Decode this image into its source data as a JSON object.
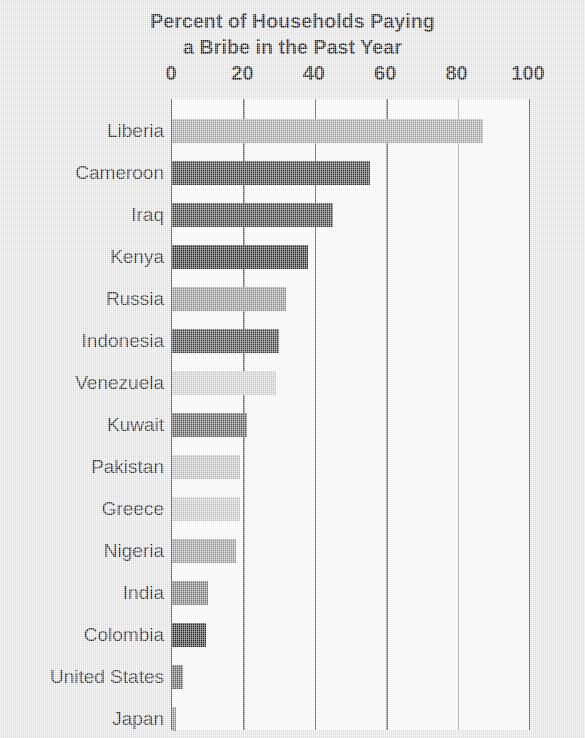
{
  "chart_data": {
    "type": "bar",
    "orientation": "horizontal",
    "title": "Percent of Households Paying a Bribe in the Past Year",
    "title_line1": "Percent of Households Paying",
    "title_line2": "a Bribe in the Past Year",
    "xlabel": "",
    "ylabel": "",
    "xlim": [
      0,
      100
    ],
    "xticks": [
      0,
      20,
      40,
      60,
      80,
      100
    ],
    "xtick_labels": [
      "0",
      "20",
      "40",
      "60",
      "80",
      "100"
    ],
    "grid": "vertical",
    "legend": "none",
    "axis_position": "top",
    "categories": [
      "Liberia",
      "Cameroon",
      "Iraq",
      "Kenya",
      "Russia",
      "Indonesia",
      "Venezuela",
      "Kuwait",
      "Pakistan",
      "Greece",
      "Nigeria",
      "India",
      "Colombia",
      "United States",
      "Japan"
    ],
    "values": [
      87,
      55.5,
      45,
      38,
      32,
      30,
      29,
      21,
      19,
      19,
      18,
      10,
      9.5,
      3,
      1
    ],
    "bar_colors": [
      "#a6a6a6",
      "#343434",
      "#3a3a3a",
      "#262626",
      "#939393",
      "#3e3e3e",
      "#d2d2d2",
      "#5b5b5b",
      "#c3c3c3",
      "#cbcbcb",
      "#9b9b9b",
      "#787878",
      "#262626",
      "#606060",
      "#8e8e8e"
    ],
    "plot_background": "#ffffff",
    "page_background": "#e9e9e9",
    "axis_color": "#5a5a5a"
  }
}
